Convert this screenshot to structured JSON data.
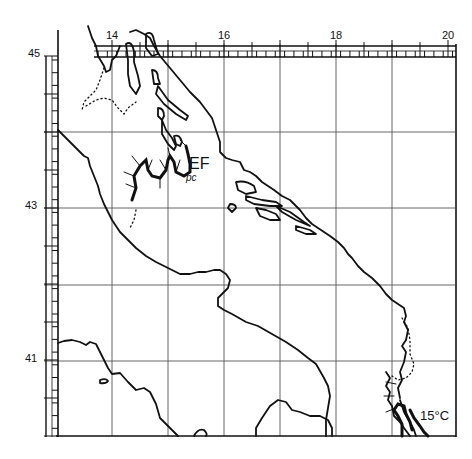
{
  "map": {
    "type": "schematic coastal map",
    "region": "Adriatic Sea",
    "colors": {
      "ink": "#111111",
      "grid": "#555555",
      "background": "#ffffff"
    },
    "longitude_labels": [
      {
        "text": "14",
        "x": 113
      },
      {
        "text": "16",
        "x": 225
      },
      {
        "text": "18",
        "x": 337
      },
      {
        "text": "20",
        "x": 449
      }
    ],
    "latitude_labels": [
      {
        "text": "45",
        "y": 56
      },
      {
        "text": "43",
        "y": 208
      },
      {
        "text": "41",
        "y": 361
      }
    ],
    "annotations": {
      "front_label": "EF",
      "front_sub": "pc",
      "temperature_label": "15°C"
    }
  }
}
